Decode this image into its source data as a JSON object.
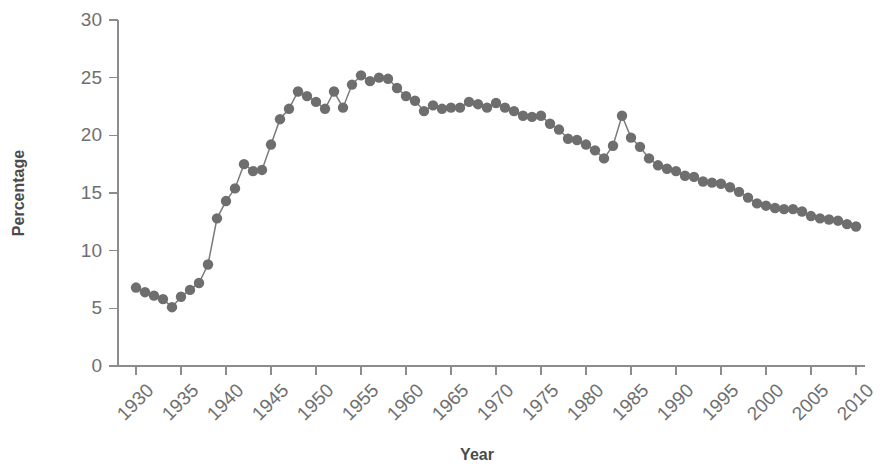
{
  "chart_data": {
    "type": "line",
    "title": "",
    "xlabel": "Year",
    "ylabel": "Percentage",
    "xlim": [
      1928,
      2011
    ],
    "ylim": [
      0,
      30
    ],
    "grid": false,
    "legend": "none",
    "marker": "filled-circle",
    "series_color": "#6e6e6e",
    "line_color": "#7a7a7a",
    "xticks": [
      1930,
      1935,
      1940,
      1945,
      1950,
      1955,
      1960,
      1965,
      1970,
      1975,
      1980,
      1985,
      1990,
      1995,
      2000,
      2005,
      2010
    ],
    "xtick_labels": [
      "1930",
      "1935",
      "1940",
      "1945",
      "1950",
      "1955",
      "1960",
      "1965",
      "1970",
      "1975",
      "1980",
      "1985",
      "1990",
      "1995",
      "2000",
      "2005",
      "2010"
    ],
    "yticks": [
      0,
      5,
      10,
      15,
      20,
      25,
      30
    ],
    "ytick_labels": [
      "0",
      "5",
      "10",
      "15",
      "20",
      "25",
      "30"
    ],
    "x": [
      1930,
      1931,
      1932,
      1933,
      1934,
      1935,
      1936,
      1937,
      1938,
      1939,
      1940,
      1941,
      1942,
      1943,
      1944,
      1945,
      1946,
      1947,
      1948,
      1949,
      1950,
      1951,
      1952,
      1953,
      1954,
      1955,
      1956,
      1957,
      1958,
      1959,
      1960,
      1961,
      1962,
      1963,
      1964,
      1965,
      1966,
      1967,
      1968,
      1969,
      1970,
      1971,
      1972,
      1973,
      1974,
      1975,
      1976,
      1977,
      1978,
      1979,
      1980,
      1981,
      1982,
      1983,
      1984,
      1985,
      1986,
      1987,
      1988,
      1989,
      1990,
      1991,
      1992,
      1993,
      1994,
      1995,
      1996,
      1997,
      1998,
      1999,
      2000,
      2001,
      2002,
      2003,
      2004,
      2005,
      2006,
      2007,
      2008,
      2009,
      2010
    ],
    "y": [
      6.8,
      6.4,
      6.1,
      5.8,
      5.1,
      6.0,
      6.6,
      7.2,
      8.8,
      12.8,
      14.3,
      15.4,
      17.5,
      16.9,
      17.0,
      19.2,
      21.4,
      22.3,
      23.8,
      23.4,
      22.9,
      22.3,
      23.8,
      22.4,
      24.4,
      25.2,
      24.7,
      25.0,
      24.9,
      24.1,
      23.4,
      23.0,
      22.1,
      22.6,
      22.3,
      22.4,
      22.4,
      22.9,
      22.7,
      22.4,
      22.8,
      22.4,
      22.1,
      21.7,
      21.6,
      21.7,
      21.0,
      20.5,
      19.7,
      19.6,
      19.2,
      18.7,
      18.0,
      19.1,
      21.7,
      19.8,
      19.0,
      18.0,
      17.4,
      17.1,
      16.9,
      16.5,
      16.4,
      16.0,
      15.9,
      15.8,
      15.5,
      15.1,
      14.6,
      14.1,
      13.9,
      13.7,
      13.6,
      13.6,
      13.4,
      13.0,
      12.8,
      12.7,
      12.6,
      12.3,
      12.1
    ]
  }
}
